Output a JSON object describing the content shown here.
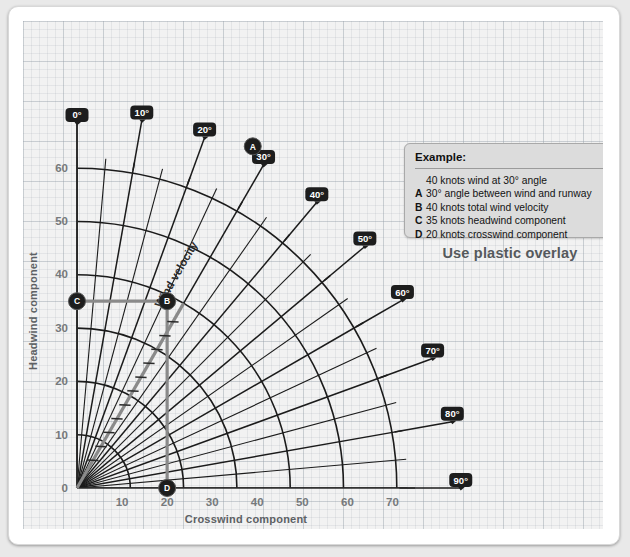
{
  "chart_data": {
    "type": "line",
    "xlabel": "Crosswind component",
    "ylabel": "Headwind component",
    "xlim": [
      0,
      75
    ],
    "ylim": [
      0,
      68
    ],
    "xticks": [
      10,
      20,
      30,
      40,
      50,
      60,
      70
    ],
    "yticks": [
      0,
      10,
      20,
      30,
      40,
      50,
      60
    ],
    "grid": true,
    "radial_rings": [
      10,
      20,
      30,
      40,
      50,
      60
    ],
    "radial_minor_step_deg": 5,
    "angle_labels": [
      "0°",
      "10°",
      "20°",
      "30°",
      "40°",
      "50°",
      "60°",
      "70°",
      "80°",
      "90°"
    ],
    "angle_values": [
      0,
      10,
      20,
      30,
      40,
      50,
      60,
      70,
      80,
      90
    ],
    "wind_velocity_label": "Wind velocity",
    "example_vector": {
      "angle_deg": 30,
      "velocity_kt": 40,
      "headwind_kt": 35,
      "crosswind_kt": 20
    },
    "points": [
      {
        "id": "A",
        "label": "A",
        "x": 39,
        "y": 64
      },
      {
        "id": "B",
        "label": "B",
        "x": 20,
        "y": 35
      },
      {
        "id": "C",
        "label": "C",
        "x": 0,
        "y": 35
      },
      {
        "id": "D",
        "label": "D",
        "x": 20,
        "y": 0
      }
    ]
  },
  "legend": {
    "title": "Example:",
    "lines": [
      {
        "key": "",
        "text": "40 knots wind at 30° angle"
      },
      {
        "key": "A",
        "text": "30° angle between wind and runway"
      },
      {
        "key": "B",
        "text": "40 knots total wind velocity"
      },
      {
        "key": "C",
        "text": "35 knots headwind component"
      },
      {
        "key": "D",
        "text": "20 knots crosswind component"
      }
    ]
  },
  "overlay_note": "Use plastic overlay",
  "colors": {
    "ink": "#1b1b1b",
    "construction": "#7d7d7d",
    "badge": "#1d1d1d",
    "panel": "#f2f2f2",
    "legend_bg": "#dcdcdc",
    "tick_text": "#76797c"
  }
}
